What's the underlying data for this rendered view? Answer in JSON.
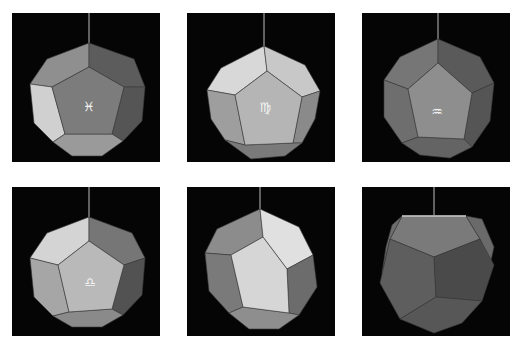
{
  "figure": {
    "layout": "2x3 grid of photographs",
    "background": "#050505",
    "page_background": "#ffffff"
  },
  "panels": [
    {
      "position": "row1-col1",
      "front_symbol": "♓",
      "symbol_name": "pisces",
      "front_face": "#7c7c7c",
      "left_face": "#d0d0d0",
      "top_left_face": "#8f8f8f",
      "top_right_face": "#5c5c5c",
      "right_face": "#555555",
      "bottom_face": "#9a9a9a"
    },
    {
      "position": "row1-col2",
      "front_symbol": "♍",
      "symbol_name": "virgo",
      "front_face": "#b5b5b5",
      "left_face": "#9e9e9e",
      "top_left_face": "#d8d8d8",
      "top_right_face": "#c8c8c8",
      "right_face": "#8a8a8a",
      "bottom_face": "#7a7a7a"
    },
    {
      "position": "row1-col3",
      "front_symbol": "♒",
      "symbol_name": "aquarius",
      "front_face": "#8e8e8e",
      "left_face": "#6e6e6e",
      "top_left_face": "#767676",
      "top_right_face": "#5a5a5a",
      "right_face": "#555555",
      "bottom_face": "#646464"
    },
    {
      "position": "row2-col1",
      "front_symbol": "♎",
      "symbol_name": "libra",
      "front_face": "#b9b9b9",
      "left_face": "#a6a6a6",
      "top_left_face": "#d4d4d4",
      "top_right_face": "#767676",
      "right_face": "#525252",
      "bottom_face": "#8a8a8a"
    },
    {
      "position": "row2-col2",
      "front_symbol": "",
      "symbol_name": "none",
      "front_face": "#d6d6d6",
      "left_face": "#7a7a7a",
      "top_left_face": "#8c8c8c",
      "top_right_face": "#e0e0e0",
      "right_face": "#6c6c6c",
      "bottom_face": "#8e8e8e"
    },
    {
      "position": "row2-col3",
      "front_symbol": "",
      "symbol_name": "none",
      "front_face": "#5e5e5e",
      "left_face": "#6e6e6e",
      "top_left_face": "#7a7a7a",
      "top_right_face": "#6a6a6a",
      "right_face": "#4a4a4a",
      "bottom_face": "#575757"
    }
  ]
}
